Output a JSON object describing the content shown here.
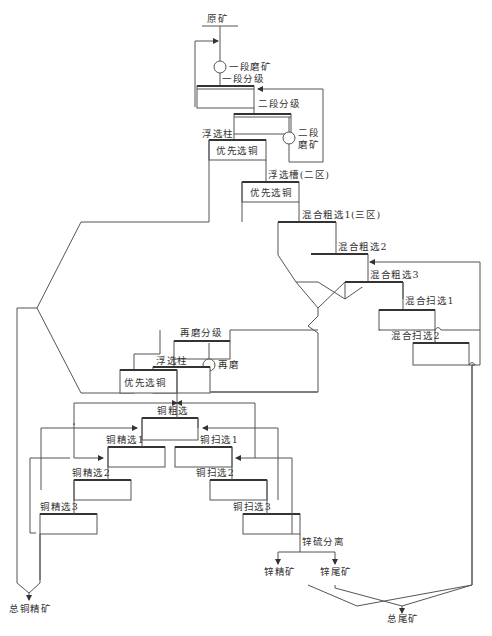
{
  "diagram": {
    "type": "mineral-processing-flowsheet",
    "colors": {
      "line": "#555555",
      "text": "#333333",
      "background": "#ffffff"
    },
    "labels": {
      "feed": "原矿",
      "primary_grinding": "一段磨矿",
      "primary_classification": "一段分级",
      "secondary_classification": "二段分级",
      "secondary_grinding_1": "二段",
      "secondary_grinding_2": "磨矿",
      "flotation_column_1": "浮选柱",
      "cu_preferential_1": "优先选铜",
      "flotation_cell_zone2": "浮选槽(二区)",
      "cu_preferential_2": "优先选铜",
      "bulk_rougher_1": "混合粗选1(三区)",
      "bulk_rougher_2": "混合粗选2",
      "bulk_rougher_3": "混合粗选3",
      "bulk_scavenger_1": "混合扫选1",
      "bulk_scavenger_2": "混合扫选2",
      "regrind_classification": "再磨分级",
      "flotation_column_2": "浮选柱",
      "regrind": "再磨",
      "cu_preferential_3": "优先选铜",
      "cu_rougher": "铜粗选",
      "cu_cleaner_1": "铜精选1",
      "cu_cleaner_2": "铜精选2",
      "cu_cleaner_3": "铜精选3",
      "cu_scavenger_1": "铜扫选1",
      "cu_scavenger_2": "铜扫选2",
      "cu_scavenger_3": "铜扫选3",
      "zn_s_separation": "锌硫分离",
      "zn_concentrate": "锌精矿",
      "zn_tailings": "锌尾矿",
      "total_cu_concentrate": "总铜精矿",
      "total_tailings": "总尾矿"
    }
  }
}
